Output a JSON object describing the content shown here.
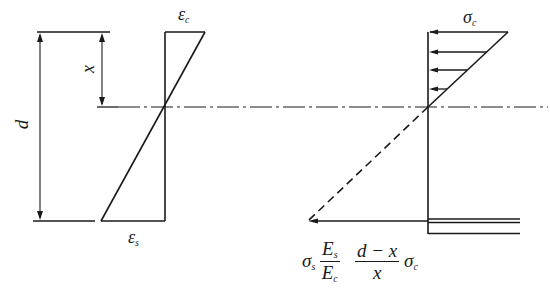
{
  "diagram": {
    "colors": {
      "stroke": "#1a1a1a",
      "background": "#ffffff"
    },
    "strain_diagram": {
      "top_label": "ε",
      "top_label_sub": "c",
      "bottom_label": "ε",
      "bottom_label_sub": "s"
    },
    "dimensions": {
      "depth_label": "d",
      "neutral_axis_depth_label": "x"
    },
    "stress_diagram": {
      "top_label": "σ",
      "top_label_sub": "c",
      "steel_label": "σ",
      "steel_label_sub": "s",
      "ratio_num": "E",
      "ratio_num_sub": "s",
      "ratio_den": "E",
      "ratio_den_sub": "c",
      "depth_ratio_num": "d − x",
      "depth_ratio_den": "x",
      "trailing_symbol": "σ",
      "trailing_symbol_sub": "c"
    }
  }
}
